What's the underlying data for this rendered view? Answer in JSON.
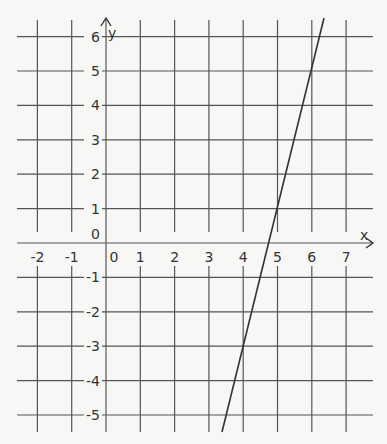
{
  "graph": {
    "x_axis_label": "x",
    "y_axis_label": "y",
    "x_ticks": [
      "-2",
      "-1",
      "0",
      "1",
      "2",
      "3",
      "4",
      "5",
      "6",
      "7"
    ],
    "y_ticks": [
      "6",
      "5",
      "4",
      "3",
      "2",
      "1",
      "0",
      "-1",
      "-2",
      "-3",
      "-4",
      "-5"
    ],
    "line": {
      "equation": "y = 4x - 19",
      "points": [
        [
          4,
          -3
        ],
        [
          5,
          1
        ]
      ]
    },
    "colors": {
      "grid": "#555555",
      "line": "#333333",
      "background": "#f7f7f5"
    }
  }
}
